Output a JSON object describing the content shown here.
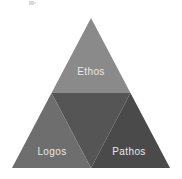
{
  "figure": {
    "name": "rhetorical-triangle",
    "background_color": "#ffffff"
  },
  "chart_data": {
    "type": "diagram",
    "subtype": "subdivided-triangle",
    "xlabel": "",
    "ylabel": "",
    "grid": false,
    "legend": "none",
    "outer_triangle": {
      "apex": [
        91,
        18
      ],
      "bottom_left": [
        12,
        168
      ],
      "bottom_right": [
        170,
        168
      ]
    },
    "midpoints": {
      "left_edge": [
        51.5,
        93
      ],
      "right_edge": [
        130.5,
        93
      ],
      "bottom_edge": [
        91,
        168
      ]
    },
    "categories": [
      "Ethos",
      "Center",
      "Logos",
      "Pathos"
    ],
    "segments": [
      {
        "id": "top",
        "label": "Ethos",
        "labelled": true,
        "color": "#8a8a8a",
        "points": "91,18 51.5,93 130.5,93",
        "label_x": 91,
        "label_y": 75
      },
      {
        "id": "center",
        "label": "",
        "labelled": false,
        "color": "#555555",
        "points": "51.5,93 130.5,93 91,168",
        "label_x": 91,
        "label_y": 124
      },
      {
        "id": "bottom-left",
        "label": "Logos",
        "labelled": true,
        "color": "#6e6e6e",
        "points": "51.5,93 91,168 12,168",
        "label_x": 52,
        "label_y": 155
      },
      {
        "id": "bottom-right",
        "label": "Pathos",
        "labelled": true,
        "color": "#4a4a4a",
        "points": "130.5,93 170,168 91,168",
        "label_x": 129,
        "label_y": 155
      }
    ],
    "colors": {
      "ethos": "#8a8a8a",
      "center": "#555555",
      "logos": "#6e6e6e",
      "pathos": "#4a4a4a",
      "label_text": "#e8e8e8",
      "divider": "#9a9a9a",
      "background": "#ffffff"
    }
  },
  "labels": {
    "ethos": "Ethos",
    "logos": "Logos",
    "pathos": "Pathos"
  }
}
